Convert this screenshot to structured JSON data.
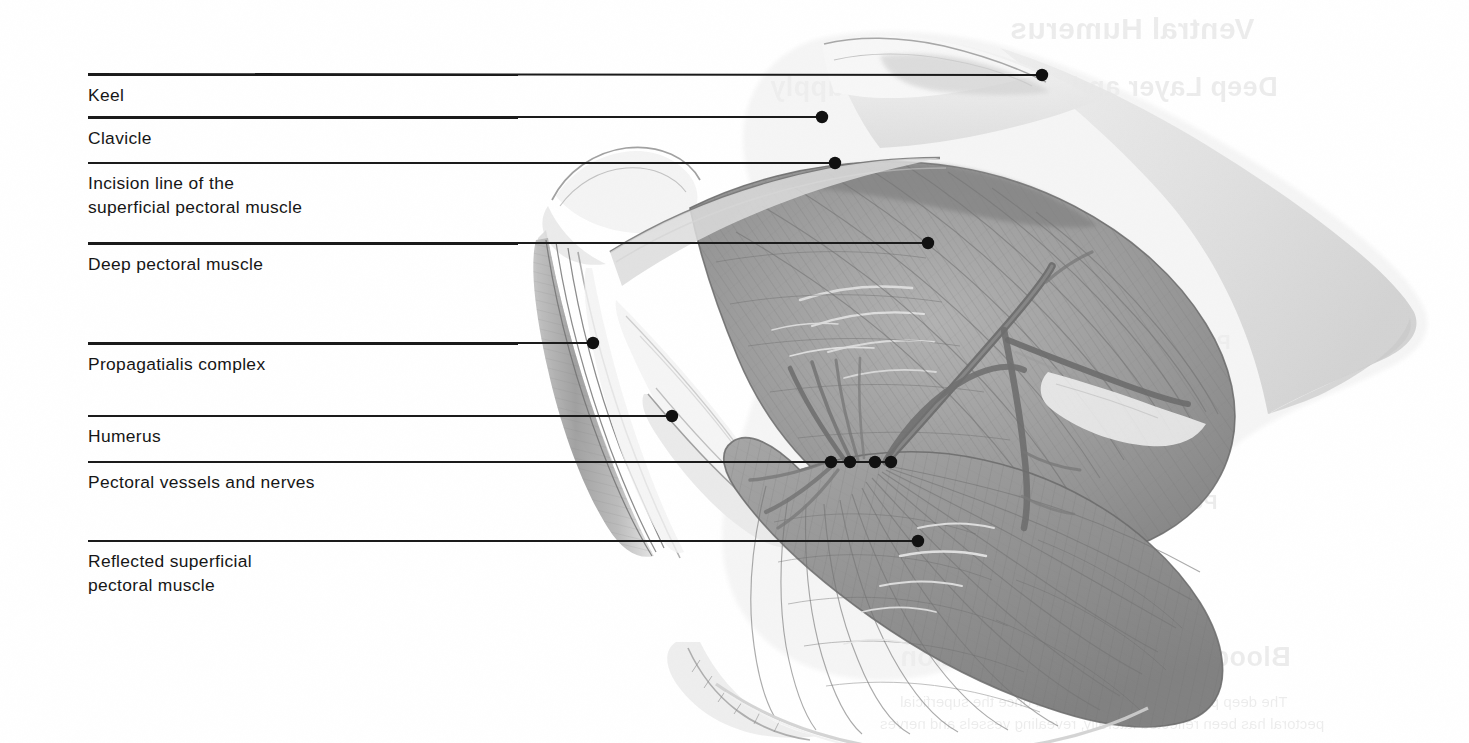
{
  "figure": {
    "kind": "anatomical-illustration",
    "medium": "grayscale pencil and wash",
    "background_color": "#ffffff",
    "ink_color": "#1b1b1b"
  },
  "labels": [
    {
      "id": "keel",
      "text": "Keel",
      "rule_y": 74,
      "rule_width": 954,
      "text_y": 84,
      "leader": {
        "x1": 88,
        "y1": 74,
        "x2": 1042,
        "y2": 75
      },
      "dots": [
        {
          "x": 1042,
          "y": 75
        }
      ]
    },
    {
      "id": "clavicle",
      "text": "Clavicle",
      "rule_y": 117,
      "rule_width": 734,
      "text_y": 127,
      "leader": {
        "x1": 88,
        "y1": 117,
        "x2": 822,
        "y2": 117
      },
      "dots": [
        {
          "x": 822,
          "y": 117
        }
      ]
    },
    {
      "id": "incision-line",
      "text": "Incision line of the\nsuperficial pectoral muscle",
      "rule_y": 162,
      "rule_width": 747,
      "text_y": 172,
      "leader": {
        "x1": 88,
        "y1": 163,
        "x2": 835,
        "y2": 163
      },
      "dots": [
        {
          "x": 835,
          "y": 163
        }
      ]
    },
    {
      "id": "deep-pectoral-muscle",
      "text": "Deep pectoral muscle",
      "rule_y": 243,
      "rule_width": 840,
      "text_y": 253,
      "leader": {
        "x1": 88,
        "y1": 243,
        "x2": 928,
        "y2": 243
      },
      "dots": [
        {
          "x": 928,
          "y": 243
        }
      ]
    },
    {
      "id": "propagatialis-complex",
      "text": "Propagatialis complex",
      "rule_y": 343,
      "rule_width": 505,
      "text_y": 353,
      "leader": {
        "x1": 88,
        "y1": 343,
        "x2": 593,
        "y2": 343
      },
      "dots": [
        {
          "x": 593,
          "y": 343
        }
      ]
    },
    {
      "id": "humerus",
      "text": "Humerus",
      "rule_y": 415,
      "rule_width": 584,
      "text_y": 425,
      "leader": {
        "x1": 88,
        "y1": 416,
        "x2": 672,
        "y2": 416
      },
      "dots": [
        {
          "x": 672,
          "y": 416
        }
      ]
    },
    {
      "id": "pectoral-vessels-and-nerves",
      "text": "Pectoral vessels and nerves",
      "rule_y": 461,
      "rule_width": 803,
      "text_y": 471,
      "leader": {
        "x1": 88,
        "y1": 462,
        "x2": 891,
        "y2": 462
      },
      "dots": [
        {
          "x": 831,
          "y": 462
        },
        {
          "x": 850,
          "y": 462
        },
        {
          "x": 875,
          "y": 462
        },
        {
          "x": 891,
          "y": 462
        }
      ]
    },
    {
      "id": "reflected-superficial-pectoral-muscle",
      "text": "Reflected superficial\npectoral muscle",
      "rule_y": 540,
      "rule_width": 830,
      "text_y": 550,
      "leader": {
        "x1": 88,
        "y1": 541,
        "x2": 918,
        "y2": 541
      },
      "dots": [
        {
          "x": 918,
          "y": 541
        }
      ]
    }
  ],
  "showthrough": [
    {
      "id": "verso-title-1",
      "text": "Ventral Humerus",
      "x": 1010,
      "y": 12,
      "style": "st-h1"
    },
    {
      "id": "verso-title-2",
      "text": "Deep Layer and Neurovascular Supply",
      "x": 770,
      "y": 72,
      "style": "st-h2"
    },
    {
      "id": "verso-head-3",
      "text": "Propatagialis",
      "x": 1095,
      "y": 330,
      "style": "st-h3"
    },
    {
      "id": "verso-head-4",
      "text": "Pectoral muscles",
      "x": 1040,
      "y": 490,
      "style": "st-h3"
    },
    {
      "id": "verso-head-5",
      "text": "Blood supply and innervation",
      "x": 900,
      "y": 642,
      "style": "st-h2"
    },
    {
      "id": "verso-body-1",
      "text": "The deep pectoral muscle is exposed once the superficial",
      "x": 900,
      "y": 690,
      "style": "st-body"
    },
    {
      "id": "verso-body-2",
      "text": "pectoral has been reflected laterally, revealing vessels and nerves",
      "x": 880,
      "y": 712,
      "style": "st-body"
    }
  ],
  "illustration": {
    "tones": {
      "muscle_mid": "#9a9a9a",
      "muscle_dark": "#7c7c7c",
      "muscle_light": "#bdbdbd",
      "membrane": "#e2e2e2",
      "bone_pale": "#f0f0f0",
      "vessel": "#6e6e6e",
      "outline": "#5a5a5a",
      "highlight": "#fbfbfb"
    },
    "parts": [
      "keel ridge",
      "clavicle (furcula)",
      "deep pectoral muscle belly",
      "propagatialis complex tendon",
      "humerus shaft",
      "pectoral vessels and nerves",
      "reflected superficial pectoral muscle flap"
    ]
  }
}
